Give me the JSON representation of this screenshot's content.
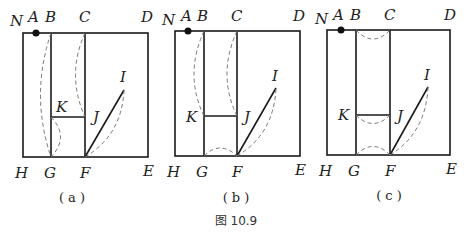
{
  "figure": {
    "caption": "图 10.9",
    "panels": [
      {
        "id": "a",
        "label": "( a )",
        "points": {
          "N": "N",
          "A": "A",
          "B": "B",
          "C": "C",
          "D": "D",
          "E": "E",
          "F": "F",
          "G": "G",
          "H": "H",
          "I": "I",
          "J": "J",
          "K": "K"
        }
      },
      {
        "id": "b",
        "label": "( b )",
        "points": {
          "N": "N",
          "A": "A",
          "B": "B",
          "C": "C",
          "D": "D",
          "E": "E",
          "F": "F",
          "G": "G",
          "H": "H",
          "I": "I",
          "J": "J",
          "K": "K"
        }
      },
      {
        "id": "c",
        "label": "( c )",
        "points": {
          "N": "N",
          "A": "A",
          "B": "B",
          "C": "C",
          "D": "D",
          "E": "E",
          "F": "F",
          "G": "G",
          "H": "H",
          "I": "I",
          "J": "J",
          "K": "K"
        }
      }
    ]
  }
}
